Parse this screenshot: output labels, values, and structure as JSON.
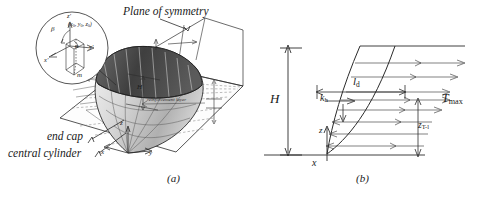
{
  "figure": {
    "panels": [
      {
        "id": "a",
        "caption": "(a)",
        "labels": {
          "plane_of_symmetry": "Plane of symmetry",
          "end_cap": "end cap",
          "central_cylinder": "central cylinder",
          "reinforcement_layer": "reinforcement layer",
          "height": "H",
          "axis_x": "x",
          "axis_y": "y",
          "axis_z": "z",
          "axis_m": "m"
        },
        "inset": {
          "angle_beta": "β",
          "angle_alpha": "α",
          "point": "(x0, y0, z0)",
          "point_x": "x",
          "point_y": "y",
          "point_z": "z",
          "point_sub": "0",
          "axis_xp": "x'",
          "axis_yp": "y'",
          "axis_zp": "z'"
        }
      },
      {
        "id": "b",
        "caption": "(b)",
        "labels": {
          "height": "H",
          "length_d": "l",
          "length_d_sub": "d",
          "seismic_coeff": "k",
          "seismic_coeff_sub": "h",
          "t_max": "T",
          "t_max_sub": "max",
          "z_tl": "z",
          "z_tl_sub": "T-l",
          "axis_z": "z",
          "axis_x": "x"
        }
      }
    ],
    "colors": {
      "ink": "#1a1a1a",
      "line": "#2b2b2b",
      "cap_dark": "#4a4a4a",
      "body_light": "#d8d8d8",
      "body_mid": "#bdbdbd",
      "grid": "#8a8a8a",
      "dash": "#6f6f6f",
      "background": "#ffffff"
    }
  }
}
